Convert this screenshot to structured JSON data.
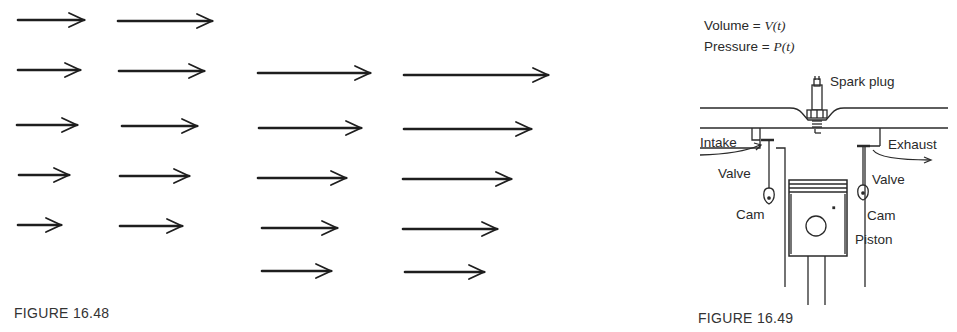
{
  "figures": [
    {
      "id": "16.48",
      "caption": "FIGURE 16.48",
      "type": "vector-field",
      "arrows": [
        {
          "row": 1,
          "y": 20,
          "x1": 18,
          "x2": 84
        },
        {
          "row": 1,
          "y": 21,
          "x1": 118,
          "x2": 212
        },
        {
          "row": 2,
          "y": 70,
          "x1": 18,
          "x2": 80
        },
        {
          "row": 2,
          "y": 71,
          "x1": 119,
          "x2": 204
        },
        {
          "row": 2,
          "y": 73,
          "x1": 258,
          "x2": 370
        },
        {
          "row": 2,
          "y": 75,
          "x1": 404,
          "x2": 548
        },
        {
          "row": 3,
          "y": 125,
          "x1": 17,
          "x2": 77
        },
        {
          "row": 3,
          "y": 126,
          "x1": 122,
          "x2": 197
        },
        {
          "row": 3,
          "y": 128,
          "x1": 259,
          "x2": 361
        },
        {
          "row": 3,
          "y": 129,
          "x1": 404,
          "x2": 531
        },
        {
          "row": 4,
          "y": 175,
          "x1": 19,
          "x2": 69
        },
        {
          "row": 4,
          "y": 176,
          "x1": 120,
          "x2": 189
        },
        {
          "row": 4,
          "y": 178,
          "x1": 258,
          "x2": 346
        },
        {
          "row": 4,
          "y": 179,
          "x1": 403,
          "x2": 511
        },
        {
          "row": 5,
          "y": 225,
          "x1": 18,
          "x2": 61
        },
        {
          "row": 5,
          "y": 226,
          "x1": 120,
          "x2": 182
        },
        {
          "row": 5,
          "y": 228,
          "x1": 262,
          "x2": 337
        },
        {
          "row": 5,
          "y": 229,
          "x1": 403,
          "x2": 497
        },
        {
          "row": 6,
          "y": 271,
          "x1": 262,
          "x2": 331
        },
        {
          "row": 6,
          "y": 272,
          "x1": 405,
          "x2": 484
        }
      ]
    },
    {
      "id": "16.49",
      "caption": "FIGURE 16.49",
      "type": "engine-cylinder-schematic",
      "labels": {
        "volume_prefix": "Volume = ",
        "volume_expr": "V(t)",
        "pressure_prefix": "Pressure = ",
        "pressure_expr": "P(t)",
        "spark_plug": "Spark plug",
        "intake": "Intake",
        "exhaust": "Exhaust",
        "valve_left": "Valve",
        "valve_right": "Valve",
        "cam_left": "Cam",
        "cam_right": "Cam",
        "piston": "Piston"
      }
    }
  ]
}
